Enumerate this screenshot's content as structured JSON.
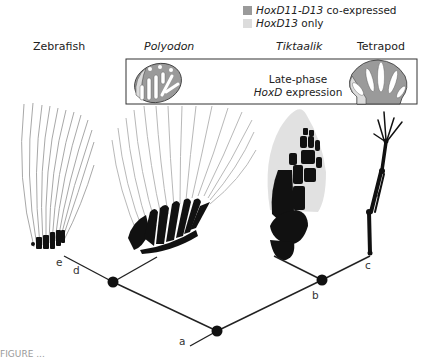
{
  "legend": {
    "items": [
      {
        "gene": "HoxD11-D13",
        "suffix": " co-expressed",
        "color": "#9a9a9a"
      },
      {
        "gene": "HoxD13",
        "suffix": " only",
        "color": "#dcdcdc"
      }
    ]
  },
  "taxa": [
    {
      "name": "Zebrafish",
      "italic": false
    },
    {
      "name": "Polyodon",
      "italic": true
    },
    {
      "name": "Tiktaalik",
      "italic": true
    },
    {
      "name": "Tetrapod",
      "italic": false
    }
  ],
  "inset_box": {
    "line1": "Late-phase",
    "line2_gene": "HoxD",
    "line2_suffix": " expression"
  },
  "tree": {
    "node_labels": [
      "a",
      "b",
      "c",
      "d",
      "e"
    ]
  },
  "caption": "FIGURE ..."
}
